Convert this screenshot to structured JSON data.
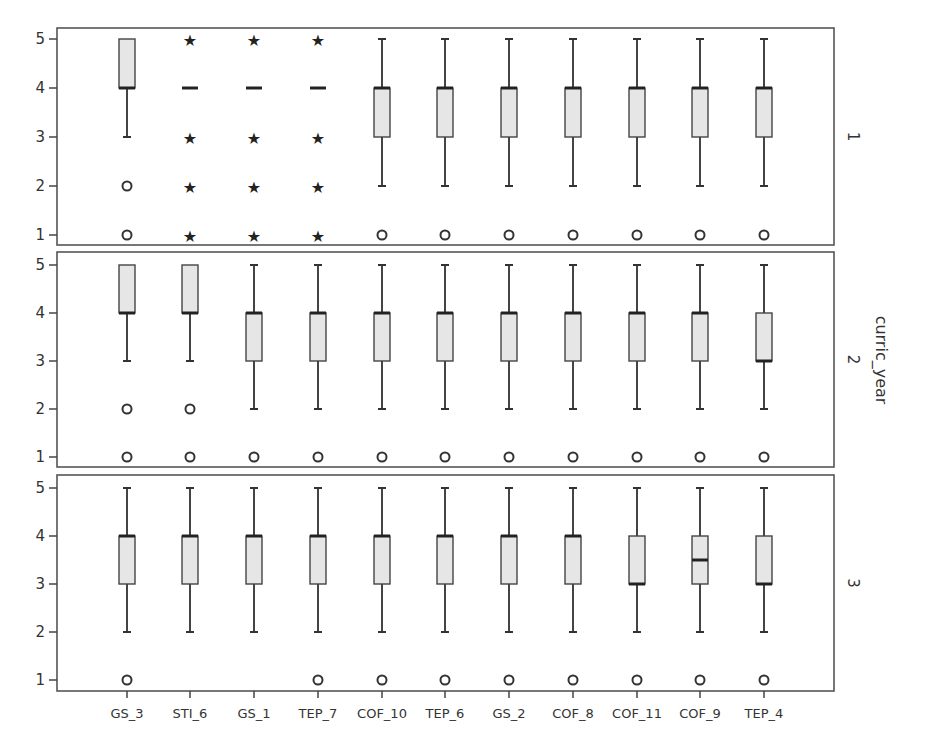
{
  "chart_data": {
    "type": "boxplot",
    "title": "",
    "xlabel": "",
    "ylabel": "",
    "facet_label": "curric_year",
    "ylim": [
      1,
      5
    ],
    "yticks": [
      1,
      2,
      3,
      4,
      5
    ],
    "categories": [
      "GS_3",
      "STI_6",
      "GS_1",
      "TEP_7",
      "COF_10",
      "TEP_6",
      "GS_2",
      "COF_8",
      "COF_11",
      "COF_9",
      "TEP_4"
    ],
    "colors": {
      "box_fill": "#e6e6e6",
      "stroke": "#444444",
      "frame": "#555555"
    },
    "facets": [
      {
        "label": "1",
        "boxes": [
          {
            "name": "GS_3",
            "q1": 4,
            "median": 4,
            "q3": 5,
            "low": 3,
            "high": 5,
            "outliers": [
              2,
              1
            ],
            "extremes": []
          },
          {
            "name": "STI_6",
            "q1": 4,
            "median": 4,
            "q3": 4,
            "low": 4,
            "high": 4,
            "outliers": [],
            "extremes": [
              5,
              3,
              2,
              1
            ]
          },
          {
            "name": "GS_1",
            "q1": 4,
            "median": 4,
            "q3": 4,
            "low": 4,
            "high": 4,
            "outliers": [],
            "extremes": [
              5,
              3,
              2,
              1
            ]
          },
          {
            "name": "TEP_7",
            "q1": 4,
            "median": 4,
            "q3": 4,
            "low": 4,
            "high": 4,
            "outliers": [],
            "extremes": [
              5,
              3,
              2,
              1
            ]
          },
          {
            "name": "COF_10",
            "q1": 3,
            "median": 4,
            "q3": 4,
            "low": 2,
            "high": 5,
            "outliers": [
              1
            ],
            "extremes": []
          },
          {
            "name": "TEP_6",
            "q1": 3,
            "median": 4,
            "q3": 4,
            "low": 2,
            "high": 5,
            "outliers": [
              1
            ],
            "extremes": []
          },
          {
            "name": "GS_2",
            "q1": 3,
            "median": 4,
            "q3": 4,
            "low": 2,
            "high": 5,
            "outliers": [
              1
            ],
            "extremes": []
          },
          {
            "name": "COF_8",
            "q1": 3,
            "median": 4,
            "q3": 4,
            "low": 2,
            "high": 5,
            "outliers": [
              1
            ],
            "extremes": []
          },
          {
            "name": "COF_11",
            "q1": 3,
            "median": 4,
            "q3": 4,
            "low": 2,
            "high": 5,
            "outliers": [
              1
            ],
            "extremes": []
          },
          {
            "name": "COF_9",
            "q1": 3,
            "median": 4,
            "q3": 4,
            "low": 2,
            "high": 5,
            "outliers": [
              1
            ],
            "extremes": []
          },
          {
            "name": "TEP_4",
            "q1": 3,
            "median": 4,
            "q3": 4,
            "low": 2,
            "high": 5,
            "outliers": [
              1
            ],
            "extremes": []
          }
        ]
      },
      {
        "label": "2",
        "boxes": [
          {
            "name": "GS_3",
            "q1": 4,
            "median": 4,
            "q3": 5,
            "low": 3,
            "high": 5,
            "outliers": [
              2,
              1
            ],
            "extremes": []
          },
          {
            "name": "STI_6",
            "q1": 4,
            "median": 4,
            "q3": 5,
            "low": 3,
            "high": 5,
            "outliers": [
              2,
              1
            ],
            "extremes": []
          },
          {
            "name": "GS_1",
            "q1": 3,
            "median": 4,
            "q3": 4,
            "low": 2,
            "high": 5,
            "outliers": [
              1
            ],
            "extremes": []
          },
          {
            "name": "TEP_7",
            "q1": 3,
            "median": 4,
            "q3": 4,
            "low": 2,
            "high": 5,
            "outliers": [
              1
            ],
            "extremes": []
          },
          {
            "name": "COF_10",
            "q1": 3,
            "median": 4,
            "q3": 4,
            "low": 2,
            "high": 5,
            "outliers": [
              1
            ],
            "extremes": []
          },
          {
            "name": "TEP_6",
            "q1": 3,
            "median": 4,
            "q3": 4,
            "low": 2,
            "high": 5,
            "outliers": [
              1
            ],
            "extremes": []
          },
          {
            "name": "GS_2",
            "q1": 3,
            "median": 4,
            "q3": 4,
            "low": 2,
            "high": 5,
            "outliers": [
              1
            ],
            "extremes": []
          },
          {
            "name": "COF_8",
            "q1": 3,
            "median": 4,
            "q3": 4,
            "low": 2,
            "high": 5,
            "outliers": [
              1
            ],
            "extremes": []
          },
          {
            "name": "COF_11",
            "q1": 3,
            "median": 4,
            "q3": 4,
            "low": 2,
            "high": 5,
            "outliers": [
              1
            ],
            "extremes": []
          },
          {
            "name": "COF_9",
            "q1": 3,
            "median": 4,
            "q3": 4,
            "low": 2,
            "high": 5,
            "outliers": [
              1
            ],
            "extremes": []
          },
          {
            "name": "TEP_4",
            "q1": 3,
            "median": 3,
            "q3": 4,
            "low": 2,
            "high": 5,
            "outliers": [
              1
            ],
            "extremes": []
          }
        ]
      },
      {
        "label": "3",
        "boxes": [
          {
            "name": "GS_3",
            "q1": 3,
            "median": 4,
            "q3": 4,
            "low": 2,
            "high": 5,
            "outliers": [
              1
            ],
            "extremes": []
          },
          {
            "name": "STI_6",
            "q1": 3,
            "median": 4,
            "q3": 4,
            "low": 2,
            "high": 5,
            "outliers": [],
            "extremes": []
          },
          {
            "name": "GS_1",
            "q1": 3,
            "median": 4,
            "q3": 4,
            "low": 2,
            "high": 5,
            "outliers": [],
            "extremes": []
          },
          {
            "name": "TEP_7",
            "q1": 3,
            "median": 4,
            "q3": 4,
            "low": 2,
            "high": 5,
            "outliers": [
              1
            ],
            "extremes": []
          },
          {
            "name": "COF_10",
            "q1": 3,
            "median": 4,
            "q3": 4,
            "low": 2,
            "high": 5,
            "outliers": [
              1
            ],
            "extremes": []
          },
          {
            "name": "TEP_6",
            "q1": 3,
            "median": 4,
            "q3": 4,
            "low": 2,
            "high": 5,
            "outliers": [
              1
            ],
            "extremes": []
          },
          {
            "name": "GS_2",
            "q1": 3,
            "median": 4,
            "q3": 4,
            "low": 2,
            "high": 5,
            "outliers": [
              1
            ],
            "extremes": []
          },
          {
            "name": "COF_8",
            "q1": 3,
            "median": 4,
            "q3": 4,
            "low": 2,
            "high": 5,
            "outliers": [
              1
            ],
            "extremes": []
          },
          {
            "name": "COF_11",
            "q1": 3,
            "median": 3,
            "q3": 4,
            "low": 2,
            "high": 5,
            "outliers": [
              1
            ],
            "extremes": []
          },
          {
            "name": "COF_9",
            "q1": 3,
            "median": 3.5,
            "q3": 4,
            "low": 2,
            "high": 5,
            "outliers": [
              1
            ],
            "extremes": []
          },
          {
            "name": "TEP_4",
            "q1": 3,
            "median": 3,
            "q3": 4,
            "low": 2,
            "high": 5,
            "outliers": [
              1
            ],
            "extremes": []
          }
        ]
      }
    ]
  },
  "layout": {
    "plot_left": 57,
    "plot_right": 834,
    "column_centers": [
      127,
      190,
      254,
      318,
      382,
      445,
      509,
      573,
      637,
      700,
      764
    ],
    "panels": [
      {
        "top": 28,
        "bottom": 245,
        "y5": 39,
        "y1": 235
      },
      {
        "top": 252,
        "bottom": 467,
        "y5": 265,
        "y1": 457
      },
      {
        "top": 475,
        "bottom": 691,
        "y5": 488,
        "y1": 680
      }
    ],
    "box_half_width": 8
  }
}
